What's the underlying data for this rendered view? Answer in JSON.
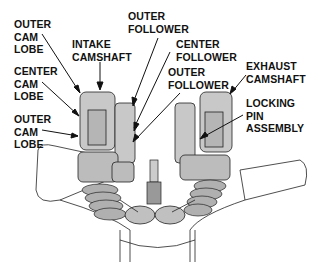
{
  "diagram": {
    "labels": {
      "outer_cam_lobe_top": "OUTER\nCAM\nLOBE",
      "intake_camshaft": "INTAKE\nCAMSHAFT",
      "outer_follower_top": "OUTER\nFOLLOWER",
      "center_follower": "CENTER\nFOLLOWER",
      "outer_follower_mid": "OUTER\nFOLLOWER",
      "exhaust_camshaft": "EXHAUST\nCAMSHAFT",
      "center_cam_lobe": "CENTER\nCAM\nLOBE",
      "locking_pin_assembly": "LOCKING\nPIN\nASSEMBLY",
      "outer_cam_lobe_bottom": "OUTER\nCAM\nLOBE"
    },
    "colors": {
      "ink": "#111111",
      "part_fill": "#c8c8c8",
      "part_shade": "#9a9a9a",
      "background": "#ffffff"
    }
  }
}
